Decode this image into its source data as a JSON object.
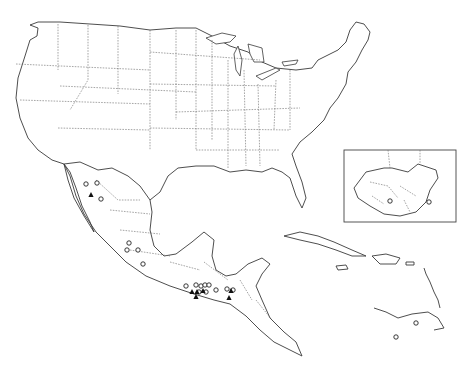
{
  "map": {
    "title": "",
    "region": "United States, Mexico, Central America and Caribbean",
    "colors": {
      "line": "#3a3a3a",
      "border": "#6a6a6a",
      "background": "#ffffff",
      "marker": "#111111"
    },
    "inset": {
      "region": "Guatemala",
      "x": 344,
      "y": 150,
      "width": 112,
      "height": 72
    },
    "markers": {
      "circles": [
        [
          86,
          184
        ],
        [
          97,
          183
        ],
        [
          101,
          199
        ],
        [
          129,
          243
        ],
        [
          127,
          250
        ],
        [
          138,
          250
        ],
        [
          143,
          264
        ],
        [
          186,
          286
        ],
        [
          196,
          285
        ],
        [
          201,
          286
        ],
        [
          205,
          285
        ],
        [
          209,
          285
        ],
        [
          199,
          292
        ],
        [
          206,
          292
        ],
        [
          216,
          290
        ],
        [
          227,
          289
        ],
        [
          233,
          290
        ],
        [
          416,
          323
        ],
        [
          396,
          337
        ],
        [
          390,
          201
        ],
        [
          429,
          202
        ]
      ],
      "triangles": [
        [
          91,
          195
        ],
        [
          192,
          292
        ],
        [
          197,
          292
        ],
        [
          203,
          291
        ],
        [
          231,
          291
        ],
        [
          229,
          298
        ],
        [
          196,
          297
        ]
      ]
    }
  }
}
